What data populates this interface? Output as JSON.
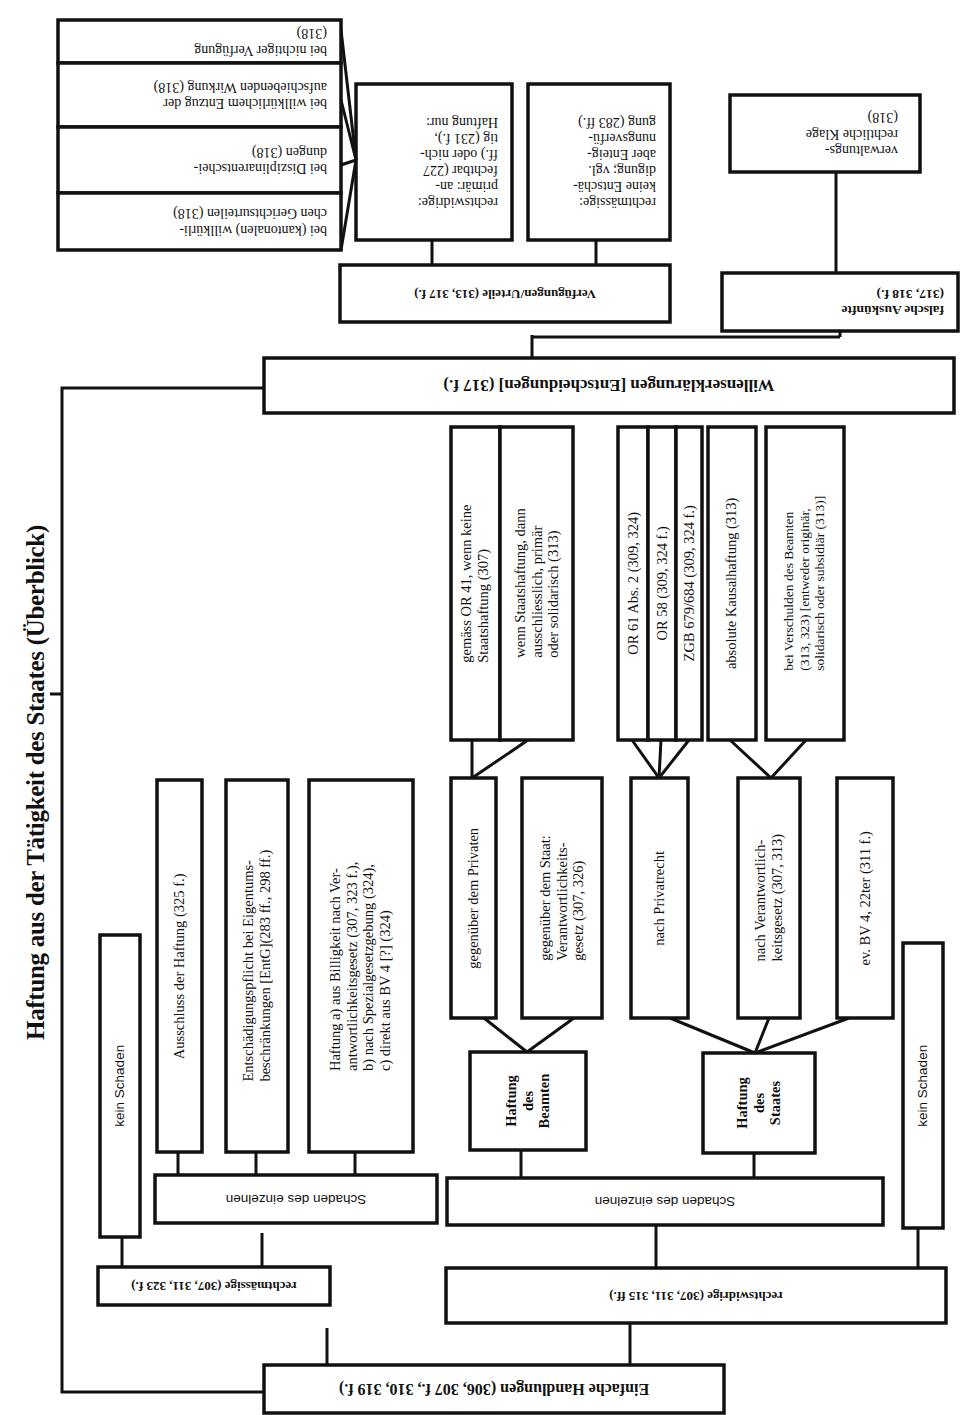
{
  "title": "Haftung aus der Tätigkeit des Staates (Überblick)",
  "root": {
    "label": "Einfache Handlungen (306, 307 f., 310, 319 f.)"
  },
  "einfache_handlungen": {
    "rechtmaessige": {
      "label": "rechtmässige (307, 311, 323 f.)",
      "kein_schaden": "kein Schaden",
      "schaden": "Schaden des einzelnen",
      "children": [
        "Ausschluss der Haftung (325 f.)",
        "Entschädigungspflicht bei Eigentums-\nbeschränkungen [EntG](283 ff., 298 ff.)",
        "Haftung a) aus Billigkeit nach Ver-\nantwortlichkeitsgesetz (307, 323 f.),\nb) nach Spezialgesetzgebung (324),\nc) direkt aus BV 4 [?] (324)"
      ]
    },
    "rechtswidrige": {
      "label": "rechtswidrige (307, 311, 315 ff.)",
      "kein_schaden": "kein Schaden",
      "schaden": "Schaden des einzelnen",
      "haftung_beamten": {
        "label": "Haftung\ndes\nBeamten",
        "branches": [
          {
            "label": "gegenüber dem Privaten",
            "details": [
              "gemäss OR 41, wenn keine\nStaatshaftung (307)",
              "wenn Staatshaftung, dann\nausschliesslich, primär\noder solidarisch (313)"
            ]
          },
          {
            "label": "gegenüber dem Staat:\nVerantwortlichkeits-\ngesetz (307, 326)",
            "details": []
          }
        ]
      },
      "haftung_staates": {
        "label": "Haftung\ndes\nStaates",
        "branches": [
          {
            "label": "nach Privatrecht",
            "details": [
              "OR 61 Abs. 2 (309, 324)",
              "OR 58 (309, 324 f.)",
              "ZGB 679/684 (309, 324 f.)"
            ]
          },
          {
            "label": "nach Verantwortlich-\nkeitsgesetz (307, 313)",
            "details": [
              "absolute Kausalhaftung (313)",
              "bei Verschulden des Beamten\n(313, 323) [entweder originär,\nsolidarisch oder subsidiär (313)]"
            ]
          },
          {
            "label": "ev. BV 4, 22ter (311 f.)",
            "details": []
          }
        ]
      }
    }
  },
  "willenserklaerungen": {
    "label": "Willenserklärungen [Entscheidungen] (317 f.)",
    "verfuegungen": {
      "label": "Verfügungen/Urteile (313, 317 f.)",
      "rechtmaessige": "rechtmässige:\nkeine Entschä-\ndigung; vgl.\naber Enteig-\nnungsverfü-\ngung (283 ff.)",
      "rechtswidrige": "rechtswidrige:\nprimär: an-\nfechtbar (227\nff.) oder nich-\ntig (231 f.),\nHaftung nur:",
      "haftung_nur": [
        "bei (kantonalen) willkürli-\nchen Gerichtsurteilen (318)",
        "bei Disziplinarentschei-\ndungen (318)",
        "bei willkürlichem Entzug der\naufschiebenden Wirkung (318)",
        "bei nichtiger Verfügung\n(318)"
      ]
    },
    "falsche_auskuenfte": {
      "label": "falsche Auskünfte\n(317, 318 f.)",
      "child": "verwaltungs-\nrechtliche Klage\n(318)"
    }
  }
}
